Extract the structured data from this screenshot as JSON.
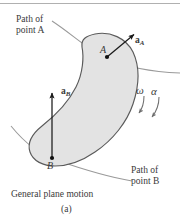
{
  "figure": {
    "caption": "General plane motion",
    "subfigure_label": "(a)",
    "path_a_label_line1": "Path of",
    "path_a_label_line2": "point A",
    "path_b_label_line1": "Path of",
    "path_b_label_line2": "point B",
    "point_a_label": "A",
    "point_b_label": "B",
    "vector_a_label": "a",
    "vector_a_subscript": "A",
    "vector_b_label": "a",
    "vector_b_subscript": "B",
    "omega_symbol": "ω",
    "alpha_symbol": "α",
    "colors": {
      "body_fill": "#e3e3e3",
      "body_stroke": "#5a5a5a",
      "path_stroke": "#9a9a9a",
      "vector_stroke": "#1a1a1a",
      "spin_arrow_stroke": "#6e6e6e",
      "rule_stroke": "#b0b0b0",
      "text": "#3a3a3a",
      "background": "#ffffff"
    },
    "geometry": {
      "point_a": [
        107,
        57
      ],
      "point_b": [
        52,
        158
      ],
      "vector_a_tip": [
        133,
        34
      ],
      "vector_b_tip": [
        56,
        92
      ],
      "top_rule_y": 3
    }
  }
}
